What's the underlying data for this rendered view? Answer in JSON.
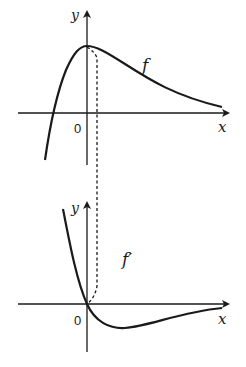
{
  "diagram": {
    "top_graph": {
      "axis_x_label": "x",
      "axis_y_label": "y",
      "origin_label": "0",
      "curve_label": "f"
    },
    "bottom_graph": {
      "axis_x_label": "x",
      "axis_y_label": "y",
      "origin_label": "0",
      "curve_label": "f′"
    },
    "colors": {
      "stroke": "#1a1a1a",
      "background": "#ffffff"
    }
  }
}
